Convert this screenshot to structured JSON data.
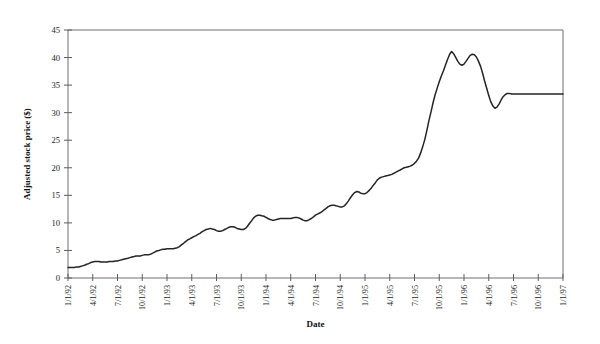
{
  "chart_data": {
    "type": "line",
    "title": "",
    "xlabel": "Date",
    "ylabel": "Adjusted stock price ($)",
    "ylim": [
      0,
      45
    ],
    "ytick_values": [
      0,
      5,
      10,
      15,
      20,
      25,
      30,
      35,
      40,
      45
    ],
    "ytick_labels": [
      "0",
      "5",
      "10",
      "15",
      "20",
      "25",
      "30",
      "35",
      "40",
      "45"
    ],
    "grid": false,
    "legend": "none",
    "xtick_labels": [
      "1/1/92",
      "4/1/92",
      "7/1/92",
      "10/1/92",
      "1/1/93",
      "4/1/93",
      "7/1/93",
      "10/1/93",
      "1/1/94",
      "4/1/94",
      "7/1/94",
      "10/1/94",
      "1/1/95",
      "4/1/95",
      "7/1/95",
      "10/1/95",
      "1/1/96",
      "4/1/96",
      "7/1/96",
      "10/1/96",
      "1/1/97"
    ],
    "line_color": "#242424",
    "axis_color": "#6e6e6e",
    "series": [
      {
        "name": "Adjusted stock price",
        "x": [
          0.0,
          0.08,
          0.17,
          0.25,
          0.33,
          0.42,
          0.5,
          0.58,
          0.67,
          0.75,
          0.83,
          0.92,
          1.0,
          1.08,
          1.17,
          1.25,
          1.33,
          1.42,
          1.5,
          1.58,
          1.67,
          1.75,
          1.83,
          1.92,
          2.0,
          2.08,
          2.17,
          2.25,
          2.33,
          2.42,
          2.5,
          2.58,
          2.67,
          2.75,
          2.83,
          2.92,
          3.0,
          3.08,
          3.17,
          3.25,
          3.33,
          3.42,
          3.5,
          3.58,
          3.67,
          3.75,
          3.83,
          3.92,
          4.0,
          4.08,
          4.17,
          4.25,
          4.33,
          4.42,
          4.5,
          4.58,
          4.67,
          4.75,
          4.83,
          4.92,
          5.0,
          5.08,
          5.17,
          5.25,
          5.33,
          5.42,
          5.5,
          5.58,
          5.67,
          5.75,
          5.83,
          5.92,
          6.0,
          6.08,
          6.17,
          6.25,
          6.33,
          6.42,
          6.5,
          6.58,
          6.67,
          6.75,
          6.83,
          6.92,
          7.0,
          7.08,
          7.17,
          7.25,
          7.33,
          7.42,
          7.5,
          7.58,
          7.67,
          7.75,
          7.83,
          7.92,
          8.0,
          8.08,
          8.17,
          8.25,
          8.33,
          8.42,
          8.5,
          8.58,
          8.67,
          8.75,
          8.83,
          8.92,
          9.0,
          9.08,
          9.17,
          9.25,
          9.33,
          9.42,
          9.5,
          9.58,
          9.67,
          9.75,
          9.83,
          9.92,
          10.0,
          10.08,
          10.17,
          10.25,
          10.33,
          10.42,
          10.5,
          10.58,
          10.67,
          10.75,
          10.83,
          10.92,
          11.0,
          11.08,
          11.17,
          11.25,
          11.33,
          11.42,
          11.5,
          11.58,
          11.67,
          11.75,
          11.83,
          11.92,
          12.0,
          12.08,
          12.17,
          12.25,
          12.33,
          12.42,
          12.5,
          12.58,
          12.67,
          12.75,
          12.83,
          12.92,
          13.0,
          13.08,
          13.17,
          13.25,
          13.33,
          13.42,
          13.5,
          13.58,
          13.67,
          13.75,
          13.83,
          13.92,
          14.0,
          14.08,
          14.17,
          14.25,
          14.33,
          14.42,
          14.5,
          14.58,
          14.67,
          14.75,
          14.83,
          14.92,
          15.0,
          15.08,
          15.17,
          15.25,
          15.33,
          15.42,
          15.5,
          15.58,
          15.67,
          15.75,
          15.83,
          15.92,
          16.0,
          16.08,
          16.17,
          16.25,
          16.33,
          16.42,
          16.5,
          16.58,
          16.67,
          16.75,
          16.83,
          16.92,
          17.0,
          17.08,
          17.17,
          17.25,
          17.33,
          17.42,
          17.5,
          17.58,
          17.67,
          17.75,
          17.83,
          17.92,
          18.0,
          18.08,
          18.17,
          18.25,
          18.33,
          18.42,
          18.5,
          18.58,
          18.67,
          18.75,
          18.83,
          18.92,
          19.0,
          19.08,
          19.17,
          19.25,
          19.33,
          19.42,
          19.5,
          19.58,
          19.67,
          19.75,
          19.83,
          19.92,
          20.0
        ],
        "values": [
          1.9,
          1.9,
          1.9,
          1.9,
          2.0,
          2.0,
          2.1,
          2.2,
          2.3,
          2.5,
          2.6,
          2.8,
          2.9,
          3.0,
          3.0,
          3.0,
          2.9,
          2.9,
          2.9,
          2.9,
          3.0,
          3.0,
          3.0,
          3.1,
          3.1,
          3.2,
          3.3,
          3.4,
          3.5,
          3.6,
          3.7,
          3.8,
          3.9,
          4.0,
          4.0,
          4.0,
          4.1,
          4.2,
          4.2,
          4.2,
          4.3,
          4.5,
          4.7,
          4.9,
          5.0,
          5.1,
          5.2,
          5.2,
          5.3,
          5.3,
          5.3,
          5.3,
          5.4,
          5.5,
          5.7,
          6.0,
          6.3,
          6.6,
          6.9,
          7.1,
          7.3,
          7.5,
          7.7,
          7.9,
          8.1,
          8.4,
          8.6,
          8.8,
          8.9,
          9.0,
          8.9,
          8.8,
          8.6,
          8.5,
          8.5,
          8.6,
          8.8,
          9.0,
          9.2,
          9.3,
          9.3,
          9.2,
          9.0,
          8.9,
          8.8,
          8.8,
          9.0,
          9.4,
          9.9,
          10.4,
          10.9,
          11.2,
          11.4,
          11.4,
          11.3,
          11.2,
          11.0,
          10.8,
          10.6,
          10.5,
          10.5,
          10.6,
          10.7,
          10.8,
          10.8,
          10.8,
          10.8,
          10.8,
          10.8,
          10.9,
          11.0,
          11.0,
          10.9,
          10.7,
          10.5,
          10.4,
          10.4,
          10.6,
          10.8,
          11.1,
          11.4,
          11.6,
          11.8,
          12.0,
          12.3,
          12.6,
          12.9,
          13.1,
          13.2,
          13.2,
          13.1,
          13.0,
          12.9,
          12.9,
          13.1,
          13.5,
          14.0,
          14.6,
          15.1,
          15.5,
          15.7,
          15.6,
          15.4,
          15.3,
          15.3,
          15.5,
          15.9,
          16.3,
          16.8,
          17.3,
          17.8,
          18.1,
          18.3,
          18.4,
          18.5,
          18.6,
          18.7,
          18.8,
          19.0,
          19.2,
          19.4,
          19.6,
          19.8,
          20.0,
          20.1,
          20.2,
          20.3,
          20.5,
          20.8,
          21.2,
          21.8,
          22.7,
          23.8,
          25.2,
          26.8,
          28.5,
          30.2,
          31.8,
          33.2,
          34.5,
          35.6,
          36.6,
          37.6,
          38.6,
          39.6,
          40.6,
          41.1,
          40.7,
          40.0,
          39.3,
          38.8,
          38.6,
          38.8,
          39.3,
          39.9,
          40.4,
          40.6,
          40.5,
          40.1,
          39.4,
          38.4,
          37.2,
          35.8,
          34.4,
          33.1,
          32.0,
          31.2,
          30.8,
          31.0,
          31.6,
          32.3,
          32.9,
          33.3,
          33.5,
          33.5,
          33.4,
          33.4,
          33.4,
          33.4,
          33.4,
          33.4,
          33.4,
          33.4,
          33.4,
          33.4,
          33.4,
          33.4,
          33.4,
          33.4,
          33.4,
          33.4,
          33.4,
          33.4,
          33.4,
          33.4,
          33.4,
          33.4,
          33.4,
          33.4,
          33.4,
          33.4
        ]
      }
    ]
  },
  "layout": {
    "plot_left": 68,
    "plot_right": 563,
    "plot_top": 30,
    "plot_bottom": 278
  }
}
